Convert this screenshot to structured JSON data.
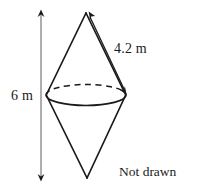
{
  "figure": {
    "shape_name": "bicone-diagram",
    "stroke_color": "#1a1a1a",
    "dimension_line_color": "#8c8c8c",
    "background_color": "#ffffff"
  },
  "labels": {
    "height": "6 m",
    "slant": "4.2 m"
  },
  "note": {
    "line1": "Not drawn",
    "line2": "accurately"
  },
  "geometry": {
    "apex_top": [
      86,
      13
    ],
    "apex_bottom": [
      87,
      178
    ],
    "ellipse_center": [
      86,
      95
    ],
    "ellipse_rx": 40,
    "ellipse_ry": 10,
    "height_arrow_x": 41,
    "height_arrow_y_top": 11,
    "height_arrow_y_bottom": 180,
    "slant_arrow_from": [
      90,
      13
    ],
    "slant_arrow_to": [
      126,
      93
    ]
  }
}
